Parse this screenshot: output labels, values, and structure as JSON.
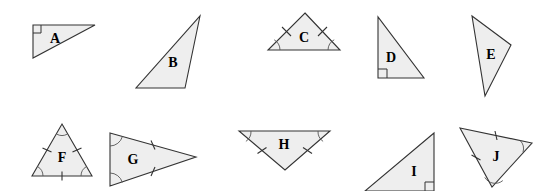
{
  "worksheet": {
    "title": "Triangle Identification Figures",
    "background_color": "#ffffff",
    "shape_fill_color": "#eeeeee",
    "shape_stroke_color": "#333333",
    "mark_color": "#333333",
    "arc_color": "#555555",
    "width": 553,
    "height": 191,
    "rows": 2,
    "shapes_per_row": 5
  },
  "shapes": [
    {
      "label": "A",
      "row": 1,
      "column": 1,
      "classification": "right scalene triangle",
      "vertices": "33,25 95,25 33,58",
      "label_x": 55,
      "label_y": 39,
      "right_angle": true,
      "right_angle_vertex": "33,25",
      "side_ticks": 0,
      "angle_arcs": 0
    },
    {
      "label": "B",
      "row": 1,
      "column": 2,
      "classification": "scalene triangle",
      "vertices": "200,16 185,88 136,88",
      "label_x": 173,
      "label_y": 63,
      "right_angle": false,
      "side_ticks": 0,
      "angle_arcs": 0
    },
    {
      "label": "C",
      "row": 1,
      "column": 3,
      "classification": "isosceles triangle",
      "vertices": "305,13 340,50 268,50",
      "label_x": 304,
      "label_y": 38,
      "right_angle": false,
      "side_ticks": 2,
      "angle_arcs": 2
    },
    {
      "label": "D",
      "row": 1,
      "column": 4,
      "classification": "right scalene triangle",
      "vertices": "378,17 378,78 424,78",
      "label_x": 391,
      "label_y": 58,
      "right_angle": true,
      "right_angle_vertex": "378,78",
      "side_ticks": 0,
      "angle_arcs": 0
    },
    {
      "label": "E",
      "row": 1,
      "column": 5,
      "classification": "scalene triangle",
      "vertices": "472,16 511,45 485,96",
      "label_x": 491,
      "label_y": 55,
      "right_angle": false,
      "side_ticks": 0,
      "angle_arcs": 0
    },
    {
      "label": "F",
      "row": 2,
      "column": 1,
      "classification": "equilateral triangle",
      "vertices": "62,124 92,176 32,176",
      "label_x": 62,
      "label_y": 158,
      "right_angle": false,
      "side_ticks": 3,
      "angle_arcs": 3
    },
    {
      "label": "G",
      "row": 2,
      "column": 2,
      "classification": "isosceles triangle",
      "vertices": "110,133 196,157 110,186",
      "label_x": 133,
      "label_y": 160,
      "right_angle": false,
      "side_ticks": 2,
      "angle_arcs": 2
    },
    {
      "label": "H",
      "row": 2,
      "column": 3,
      "classification": "isosceles triangle",
      "vertices": "239,131 330,131 285,170",
      "label_x": 284,
      "label_y": 145,
      "right_angle": false,
      "side_ticks": 2,
      "angle_arcs": 2
    },
    {
      "label": "I",
      "row": 2,
      "column": 4,
      "classification": "right scalene triangle",
      "vertices": "434,133 434,191 365,191",
      "label_x": 414,
      "label_y": 172,
      "right_angle": true,
      "right_angle_vertex": "434,191",
      "side_ticks": 0,
      "angle_arcs": 0
    },
    {
      "label": "J",
      "row": 2,
      "column": 5,
      "classification": "isosceles triangle",
      "vertices": "460,128 532,143 492,187",
      "label_x": 496,
      "label_y": 157,
      "right_angle": false,
      "side_ticks": 2,
      "angle_arcs": 2
    }
  ]
}
